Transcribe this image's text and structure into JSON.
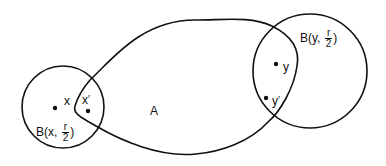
{
  "diagram": {
    "type": "set-diagram",
    "stroke_color": "#111111",
    "background": "#ffffff",
    "region": {
      "label": "A",
      "description": "closed curved region connecting the two balls"
    },
    "balls": [
      {
        "id": "ball-x",
        "label_prefix": "B(x,",
        "fraction_num": "r",
        "fraction_den": "2",
        "label_suffix": ")",
        "center": [
          63,
          107
        ],
        "radius": 41
      },
      {
        "id": "ball-y",
        "label_prefix": "B(y,",
        "fraction_num": "r",
        "fraction_den": "2",
        "label_suffix": ")",
        "center": [
          310,
          71
        ],
        "radius": 57
      }
    ],
    "points": [
      {
        "id": "x",
        "label": "x",
        "prime": ""
      },
      {
        "id": "x-prime",
        "label": "x",
        "prime": "′"
      },
      {
        "id": "y",
        "label": "y",
        "prime": ""
      },
      {
        "id": "y-prime",
        "label": "y",
        "prime": "′"
      }
    ]
  }
}
